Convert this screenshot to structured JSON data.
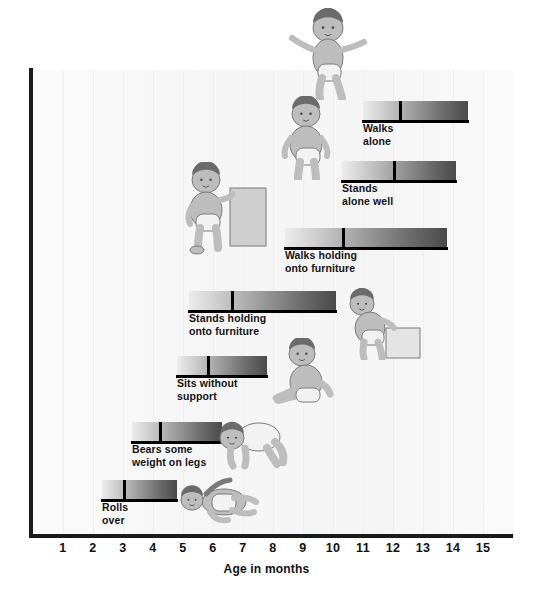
{
  "chart_data": {
    "type": "bar",
    "title": "",
    "subtitle": "",
    "xlabel": "Age in months",
    "ylabel": "",
    "xlim": [
      0,
      16
    ],
    "xticks": [
      1,
      2,
      3,
      4,
      5,
      6,
      7,
      8,
      9,
      10,
      11,
      12,
      13,
      14,
      15
    ],
    "xtick_labels": [
      "1",
      "2",
      "3",
      "4",
      "5",
      "6",
      "7",
      "8",
      "9",
      "10",
      "11",
      "12",
      "13",
      "14",
      "15"
    ],
    "grid": true,
    "legend": "none",
    "orientation": "horizontal",
    "note": "Each horizontal bar spans the age range over which the milestone is typically achieved; the black vertical tick marks the median age.",
    "categories": [
      "Rolls over",
      "Bears some weight on legs",
      "Sits without support",
      "Stands holding onto furniture",
      "Walks holding onto furniture",
      "Stands alone well",
      "Walks alone"
    ],
    "bars": [
      {
        "label": "Rolls\nover",
        "label_oneline": "Rolls over",
        "start_month": 2.3,
        "median_month": 3.0,
        "end_month": 4.8
      },
      {
        "label": "Bears some\nweight on legs",
        "label_oneline": "Bears some weight on legs",
        "start_month": 3.3,
        "median_month": 4.2,
        "end_month": 6.3
      },
      {
        "label": "Sits without\nsupport",
        "label_oneline": "Sits without support",
        "start_month": 4.8,
        "median_month": 5.8,
        "end_month": 7.8
      },
      {
        "label": "Stands holding\nonto furniture",
        "label_oneline": "Stands holding onto furniture",
        "start_month": 5.2,
        "median_month": 6.6,
        "end_month": 10.1
      },
      {
        "label": "Walks holding\nonto furniture",
        "label_oneline": "Walks holding onto furniture",
        "start_month": 8.4,
        "median_month": 10.3,
        "end_month": 13.8
      },
      {
        "label": "Stands\nalone well",
        "label_oneline": "Stands alone well",
        "start_month": 10.3,
        "median_month": 12.0,
        "end_month": 14.1
      },
      {
        "label": "Walks\nalone",
        "label_oneline": "Walks alone",
        "start_month": 11.0,
        "median_month": 12.2,
        "end_month": 14.5
      }
    ]
  },
  "figures": [
    {
      "name": "baby-lying-rolling",
      "milestone": "Rolls over"
    },
    {
      "name": "baby-crawling",
      "milestone": "Bears some weight on legs"
    },
    {
      "name": "baby-sitting",
      "milestone": "Sits without support"
    },
    {
      "name": "baby-pulling-up-on-box",
      "milestone": "Stands holding onto furniture"
    },
    {
      "name": "baby-standing-at-furniture",
      "milestone": "Walks holding onto furniture"
    },
    {
      "name": "baby-standing-alone",
      "milestone": "Stands alone well"
    },
    {
      "name": "toddler-walking",
      "milestone": "Walks alone"
    }
  ],
  "colors": {
    "bar_gradient_start": "#ececec",
    "bar_gradient_end": "#4a4a4a",
    "axis": "#1a1a1a",
    "text": "#101010",
    "background": "#ffffff",
    "plot_background": "#fbfbfb",
    "gridline": "#efefef"
  }
}
